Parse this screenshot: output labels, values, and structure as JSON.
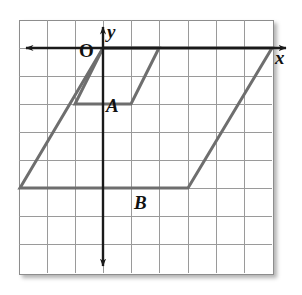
{
  "figure": {
    "kind": "coordinate-grid-geometry-figure",
    "background_color": "#ffffff",
    "grid": {
      "columns": 9,
      "rows": 9,
      "cell_size_px": 28,
      "origin_px": {
        "x": 103,
        "y": 48
      },
      "left_px": 19,
      "top_px": 20,
      "width_px": 253,
      "height_px": 253,
      "grid_line_color": "#9a9a9a",
      "border_color": "#8d8d8d",
      "grid_visible": true
    },
    "axes": {
      "x_axis": {
        "label": "x",
        "color": "#1a1a1a",
        "y_px": 48,
        "arrow_left": true,
        "arrow_right": true,
        "x_start_px": 22,
        "x_end_px": 290
      },
      "y_axis": {
        "label": "y",
        "color": "#1a1a1a",
        "x_px": 103,
        "arrow_up": true,
        "arrow_down": true,
        "y_start_px": 22,
        "y_end_px": 272
      },
      "origin_label": "O"
    },
    "shapes": [
      {
        "name": "small-parallelogram",
        "label": "A",
        "stroke_color": "#6e6e6e",
        "stroke_width_px": 3,
        "fill": "none",
        "vertices_px": [
          {
            "x": 75,
            "y": 104
          },
          {
            "x": 131,
            "y": 104
          },
          {
            "x": 159,
            "y": 48
          },
          {
            "x": 103,
            "y": 48
          }
        ],
        "vertices_grid": [
          {
            "x": -1,
            "y": -2
          },
          {
            "x": 1,
            "y": -2
          },
          {
            "x": 2,
            "y": 0
          },
          {
            "x": 0,
            "y": 0
          }
        ]
      },
      {
        "name": "large-parallelogram",
        "label": "B",
        "stroke_color": "#6e6e6e",
        "stroke_width_px": 3,
        "fill": "none",
        "vertices_px": [
          {
            "x": 20,
            "y": 188
          },
          {
            "x": 188,
            "y": 188
          },
          {
            "x": 272,
            "y": 48
          },
          {
            "x": 103,
            "y": 48
          }
        ],
        "vertices_grid": [
          {
            "x": -3,
            "y": -5
          },
          {
            "x": 3,
            "y": -5
          },
          {
            "x": 6,
            "y": 0
          },
          {
            "x": 0,
            "y": 0
          }
        ]
      }
    ],
    "labels": [
      {
        "name": "y-axis-label",
        "text": "y"
      },
      {
        "name": "x-axis-label",
        "text": "x"
      },
      {
        "name": "origin-label",
        "text": "O"
      },
      {
        "name": "point-label-a",
        "text": "A"
      },
      {
        "name": "point-label-b",
        "text": "B"
      }
    ]
  }
}
